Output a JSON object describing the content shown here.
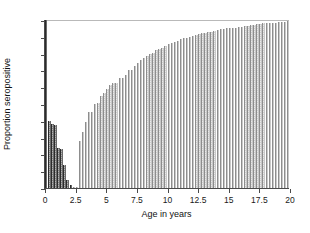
{
  "chart_data": {
    "type": "bar",
    "title": "",
    "subtitle": "",
    "xlabel": "Age in years",
    "ylabel": "Proportion seropositive",
    "xlim": [
      0,
      20
    ],
    "ylim": [
      0,
      1
    ],
    "grid": false,
    "legend": null,
    "xticks": [
      0,
      2.5,
      5,
      7.5,
      10,
      12.5,
      15,
      17.5,
      20
    ],
    "xticklabels": [
      "0",
      "2.5",
      "5",
      "7.5",
      "10",
      "12.5",
      "15",
      "17.5",
      "20"
    ],
    "yticks": [
      0,
      0.1,
      0.2,
      0.3,
      0.4,
      0.5,
      0.6,
      0.7,
      0.8,
      0.9,
      1
    ],
    "yticklabels": [
      "0",
      "0.1",
      "0.2",
      "0.3",
      "0.4",
      "0.5",
      "0.6",
      "0.7",
      "0.8",
      "0.9",
      "1"
    ],
    "bar_width_years": 0.25,
    "colors": {
      "bar_light": "#a9a9a9",
      "bar_dark": "#4d4d4d",
      "axis": "#4a4a4a",
      "text": "#111111",
      "background": "#ffffff"
    },
    "x": [
      0,
      0.25,
      0.5,
      0.75,
      1,
      1.25,
      1.5,
      1.75,
      2,
      2.25,
      2.5,
      2.75,
      3,
      3.25,
      3.5,
      3.75,
      4,
      4.25,
      4.5,
      4.75,
      5,
      5.25,
      5.5,
      5.75,
      6,
      6.25,
      6.5,
      6.75,
      7,
      7.25,
      7.5,
      7.75,
      8,
      8.25,
      8.5,
      8.75,
      9,
      9.25,
      9.5,
      9.75,
      10,
      10.25,
      10.5,
      10.75,
      11,
      11.25,
      11.5,
      11.75,
      12,
      12.25,
      12.5,
      12.75,
      13,
      13.25,
      13.5,
      13.75,
      14,
      14.25,
      14.5,
      14.75,
      15,
      15.25,
      15.5,
      15.75,
      16,
      16.25,
      16.5,
      16.75,
      17,
      17.25,
      17.5,
      17.75,
      18,
      18.25,
      18.5,
      18.75,
      19,
      19.25,
      19.5,
      19.75
    ],
    "values": [
      1.0,
      0.4,
      0.38,
      0.375,
      0.24,
      0.235,
      0.135,
      0.05,
      0.02,
      0.005,
      0.005,
      0.28,
      0.335,
      0.39,
      0.45,
      0.45,
      0.5,
      0.505,
      0.545,
      0.565,
      0.59,
      0.615,
      0.625,
      0.625,
      0.655,
      0.655,
      0.67,
      0.705,
      0.705,
      0.725,
      0.745,
      0.76,
      0.775,
      0.785,
      0.8,
      0.805,
      0.82,
      0.825,
      0.835,
      0.845,
      0.855,
      0.865,
      0.87,
      0.875,
      0.885,
      0.89,
      0.895,
      0.9,
      0.905,
      0.91,
      0.915,
      0.92,
      0.925,
      0.93,
      0.93,
      0.935,
      0.94,
      0.945,
      0.945,
      0.95,
      0.95,
      0.955,
      0.955,
      0.96,
      0.96,
      0.965,
      0.965,
      0.97,
      0.97,
      0.975,
      0.975,
      0.98,
      0.98,
      0.98,
      0.985,
      0.985,
      0.99,
      0.99,
      0.99,
      0.995
    ],
    "dark_bar_count": 9
  }
}
